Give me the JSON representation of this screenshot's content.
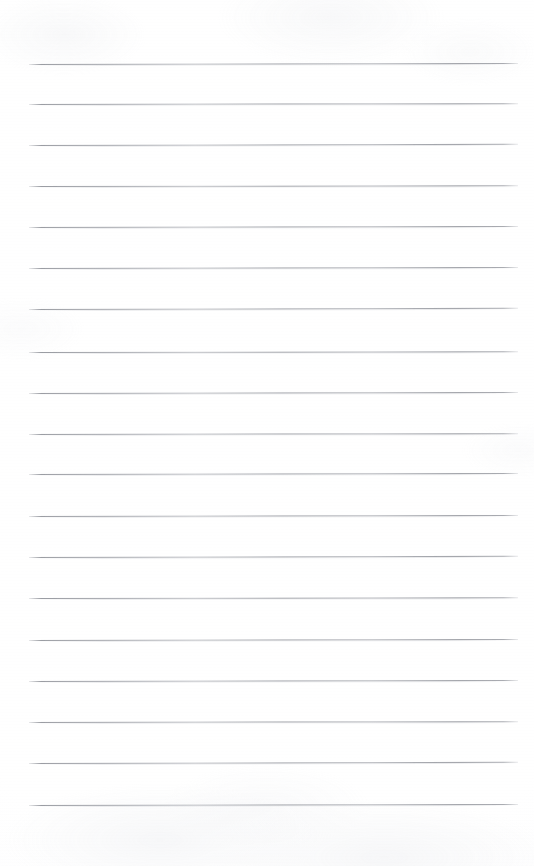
{
  "document": {
    "kind": "blank-ruled-notepad-page",
    "title": "Blank Ruled Notepad Page",
    "visible_text": "",
    "page_width": 534,
    "page_height": 866,
    "background_color": "#ffffff",
    "paper_tint": "#fdfdfe",
    "has_handwriting": false,
    "has_header_text": false,
    "has_page_number": false,
    "has_margin_rule": false
  },
  "ruling": {
    "line_color": "#84878f",
    "line_thickness_px": 1,
    "line_count": 20,
    "left_x": 29,
    "right_x": 518,
    "line_length_px": 489,
    "first_line_y": 64,
    "spacing_px": 41,
    "top_margin_px": 64,
    "bottom_margin_px": 61,
    "lines": [
      {
        "index": 1,
        "y": 64,
        "left": 29,
        "right": 518,
        "tilt_deg": -0.12
      },
      {
        "index": 2,
        "y": 104,
        "left": 29,
        "right": 518,
        "tilt_deg": -0.1
      },
      {
        "index": 3,
        "y": 145,
        "left": 29,
        "right": 518,
        "tilt_deg": -0.14
      },
      {
        "index": 4,
        "y": 186,
        "left": 29,
        "right": 518,
        "tilt_deg": -0.09
      },
      {
        "index": 5,
        "y": 227,
        "left": 29,
        "right": 518,
        "tilt_deg": -0.13
      },
      {
        "index": 6,
        "y": 268,
        "left": 29,
        "right": 518,
        "tilt_deg": -0.11
      },
      {
        "index": 7,
        "y": 309,
        "left": 29,
        "right": 518,
        "tilt_deg": -0.15
      },
      {
        "index": 8,
        "y": 352,
        "left": 29,
        "right": 518,
        "tilt_deg": -0.08
      },
      {
        "index": 9,
        "y": 393,
        "left": 29,
        "right": 518,
        "tilt_deg": -0.12
      },
      {
        "index": 10,
        "y": 434,
        "left": 29,
        "right": 518,
        "tilt_deg": -0.1
      },
      {
        "index": 11,
        "y": 474,
        "left": 29,
        "right": 518,
        "tilt_deg": -0.13
      },
      {
        "index": 12,
        "y": 516,
        "left": 29,
        "right": 518,
        "tilt_deg": -0.11
      },
      {
        "index": 13,
        "y": 557,
        "left": 29,
        "right": 518,
        "tilt_deg": -0.14
      },
      {
        "index": 14,
        "y": 598,
        "left": 29,
        "right": 518,
        "tilt_deg": -0.09
      },
      {
        "index": 15,
        "y": 640,
        "left": 29,
        "right": 518,
        "tilt_deg": -0.12
      },
      {
        "index": 16,
        "y": 681,
        "left": 29,
        "right": 518,
        "tilt_deg": -0.13
      },
      {
        "index": 17,
        "y": 722,
        "left": 29,
        "right": 518,
        "tilt_deg": -0.1
      },
      {
        "index": 18,
        "y": 763,
        "left": 29,
        "right": 518,
        "tilt_deg": -0.14
      },
      {
        "index": 19,
        "y": 805,
        "left": 29,
        "right": 518,
        "tilt_deg": -0.11
      },
      {
        "index": 20,
        "y": 846,
        "left": 29,
        "right": 518,
        "tilt_deg": -0.12,
        "visible": false
      }
    ]
  }
}
